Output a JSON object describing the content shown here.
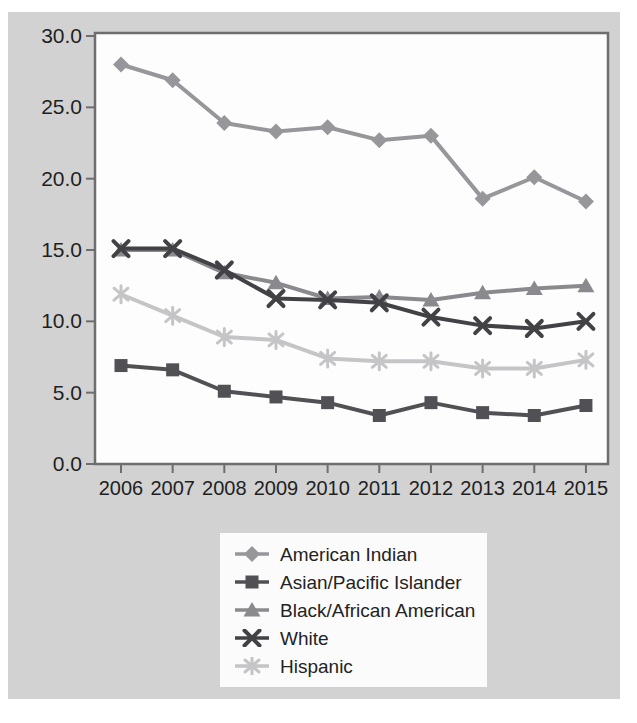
{
  "palette": {
    "panel_bg": "#d2d2d2",
    "plot_bg": "#fdfdfd",
    "plot_border": "#6e6e6e",
    "tick_color": "#6e6e6e",
    "axis_text": "#1f1f1f",
    "legend_bg": "#fbfbfb"
  },
  "chart_data": {
    "type": "line",
    "title": "",
    "xlabel": "",
    "ylabel": "",
    "grid": false,
    "legend_position": "bottom-center",
    "ylim": [
      0,
      30.2
    ],
    "x_labels": [
      "2006",
      "2007",
      "2008",
      "2009",
      "2010",
      "2011",
      "2012",
      "2013",
      "2014",
      "2015"
    ],
    "y_tick_labels": [
      "0.0",
      "5.0",
      "10.0",
      "15.0",
      "20.0",
      "25.0",
      "30.0"
    ],
    "series": [
      {
        "name": "American Indian",
        "marker": "diamond",
        "color": "#97979b",
        "values": [
          28.0,
          26.9,
          23.9,
          23.3,
          23.6,
          22.7,
          23.0,
          18.6,
          20.1,
          18.4
        ]
      },
      {
        "name": "Asian/Pacific Islander",
        "marker": "square",
        "color": "#515155",
        "values": [
          6.9,
          6.6,
          5.1,
          4.7,
          4.3,
          3.4,
          4.3,
          3.6,
          3.4,
          4.1
        ]
      },
      {
        "name": "Black/African American",
        "marker": "triangle",
        "color": "#8a8a8e",
        "values": [
          15.0,
          15.0,
          13.4,
          12.7,
          11.6,
          11.7,
          11.5,
          12.0,
          12.3,
          12.5
        ]
      },
      {
        "name": "White",
        "marker": "x",
        "color": "#424246",
        "values": [
          15.1,
          15.1,
          13.6,
          11.6,
          11.5,
          11.3,
          10.3,
          9.7,
          9.5,
          10.0
        ]
      },
      {
        "name": "Hispanic",
        "marker": "asterisk",
        "color": "#c5c5c7",
        "values": [
          11.9,
          10.4,
          8.9,
          8.7,
          7.4,
          7.2,
          7.2,
          6.7,
          6.7,
          7.3
        ]
      }
    ]
  }
}
